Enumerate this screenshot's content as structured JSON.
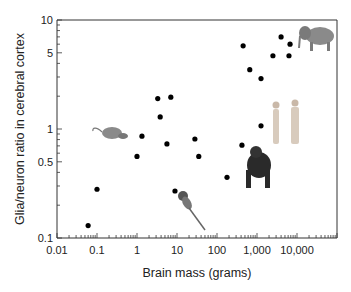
{
  "chart_data": {
    "type": "scatter",
    "title": "",
    "xlabel": "Brain mass (grams)",
    "ylabel": "Glia/neuron ratio in cerebral cortex",
    "xscale": "log",
    "yscale": "log",
    "xlim": [
      0.01,
      100000
    ],
    "ylim": [
      0.1,
      10
    ],
    "grid": false,
    "x_tick_labels": [
      {
        "value": 0.01,
        "label": "0.01"
      },
      {
        "value": 0.1,
        "label": "0.1"
      },
      {
        "value": 1,
        "label": "1"
      },
      {
        "value": 10,
        "label": "10"
      },
      {
        "value": 100,
        "label": "100"
      },
      {
        "value": 1000,
        "label": "1,000"
      },
      {
        "value": 10000,
        "label": "10,000"
      }
    ],
    "y_tick_labels": [
      {
        "value": 0.1,
        "label": "0.1"
      },
      {
        "value": 0.5,
        "label": "0.5"
      },
      {
        "value": 1,
        "label": "1"
      },
      {
        "value": 5,
        "label": "5"
      },
      {
        "value": 10,
        "label": "10"
      }
    ],
    "points": [
      {
        "x": 0.06,
        "y": 0.13
      },
      {
        "x": 0.1,
        "y": 0.28
      },
      {
        "x": 1.0,
        "y": 0.56
      },
      {
        "x": 1.33,
        "y": 0.86
      },
      {
        "x": 3.3,
        "y": 1.9
      },
      {
        "x": 7.0,
        "y": 1.96
      },
      {
        "x": 3.8,
        "y": 1.29
      },
      {
        "x": 5.6,
        "y": 0.73
      },
      {
        "x": 8.9,
        "y": 0.27
      },
      {
        "x": 28,
        "y": 0.81
      },
      {
        "x": 35,
        "y": 0.56
      },
      {
        "x": 178,
        "y": 0.36
      },
      {
        "x": 420,
        "y": 0.71
      },
      {
        "x": 1260,
        "y": 1.07
      },
      {
        "x": 450,
        "y": 5.8
      },
      {
        "x": 660,
        "y": 3.5
      },
      {
        "x": 1260,
        "y": 2.9
      },
      {
        "x": 2500,
        "y": 4.7
      },
      {
        "x": 4000,
        "y": 7.0
      },
      {
        "x": 6700,
        "y": 6.0
      },
      {
        "x": 6300,
        "y": 4.7
      }
    ],
    "illustrations": [
      {
        "name": "shrew",
        "icon": "shrew-icon",
        "near": {
          "x": 0.4,
          "y": 0.95
        }
      },
      {
        "name": "marmoset",
        "icon": "marmoset-icon",
        "near": {
          "x": 12,
          "y": 0.2
        }
      },
      {
        "name": "chimpanzee",
        "icon": "chimpanzee-icon",
        "near": {
          "x": 900,
          "y": 0.45
        }
      },
      {
        "name": "humans",
        "icon": "humans-icon",
        "near": {
          "x": 5000,
          "y": 1.2
        }
      },
      {
        "name": "elephant",
        "icon": "elephant-icon",
        "near": {
          "x": 30000,
          "y": 7
        }
      }
    ]
  }
}
